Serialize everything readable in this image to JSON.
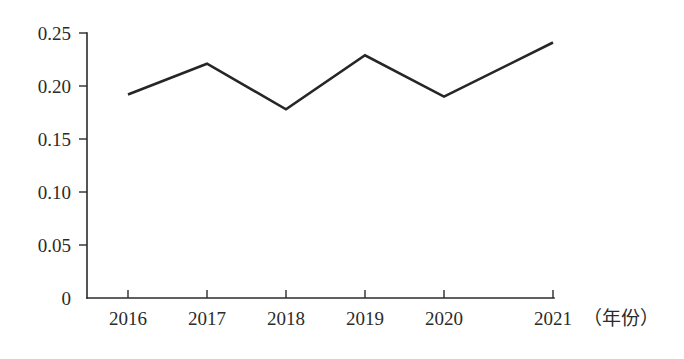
{
  "chart_data": {
    "type": "line",
    "title": "",
    "subtitle": "",
    "xlabel": "（年份）",
    "ylabel": "",
    "categories": [
      "2016",
      "2017",
      "2018",
      "2019",
      "2020",
      "2021"
    ],
    "values": [
      0.192,
      0.221,
      0.178,
      0.229,
      0.19,
      0.241
    ],
    "series": [
      {
        "name": "",
        "values": [
          0.192,
          0.221,
          0.178,
          0.229,
          0.19,
          0.241
        ]
      }
    ],
    "x_tick_labels": [
      "2016",
      "2017",
      "2018",
      "2019",
      "2020",
      "2021"
    ],
    "y_tick_labels": [
      "0",
      "0.05",
      "0.10",
      "0.15",
      "0.20",
      "0.25"
    ],
    "y_tick_values": [
      0,
      0.05,
      0.1,
      0.15,
      0.2,
      0.25
    ],
    "ylim": [
      0,
      0.25
    ],
    "xlim": [
      "2016",
      "2021"
    ],
    "grid": false,
    "legend": false,
    "legend_position": "none",
    "annotations": [],
    "colors": {
      "line": "#262626",
      "axis": "#2b2b2b",
      "text": "#2b2b2b",
      "background": "#ffffff"
    }
  },
  "axis": {
    "x_caption": "（年份）",
    "y_ticks": [
      {
        "label": "0.25",
        "value": 0.25
      },
      {
        "label": "0.20",
        "value": 0.2
      },
      {
        "label": "0.15",
        "value": 0.15
      },
      {
        "label": "0.10",
        "value": 0.1
      },
      {
        "label": "0.05",
        "value": 0.05
      },
      {
        "label": "0",
        "value": 0
      }
    ],
    "x_ticks": [
      {
        "label": "2016"
      },
      {
        "label": "2017"
      },
      {
        "label": "2018"
      },
      {
        "label": "2019"
      },
      {
        "label": "2020"
      },
      {
        "label": "2021"
      }
    ]
  }
}
